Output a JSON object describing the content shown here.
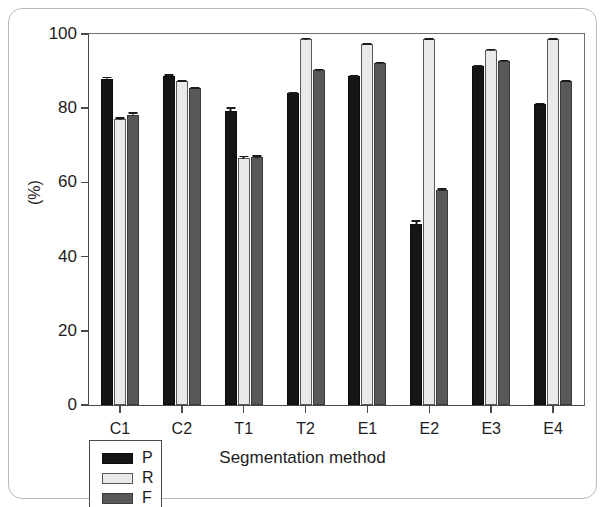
{
  "chart_data": {
    "type": "bar",
    "title": "",
    "subtitle": "",
    "xlabel": "Segmentation method",
    "ylabel": "(%)",
    "categories": [
      "C1",
      "C2",
      "T1",
      "T2",
      "E1",
      "E2",
      "E3",
      "E4"
    ],
    "ylim": [
      0,
      100
    ],
    "yticks": [
      0,
      20,
      40,
      60,
      80,
      100
    ],
    "ytick_labels": [
      "0",
      "20",
      "40",
      "60",
      "80",
      "100"
    ],
    "grid": false,
    "legend_position": "bottom-left",
    "error_bars": true,
    "series": [
      {
        "name": "P",
        "color": "#151515",
        "values": [
          88.0,
          88.8,
          79.3,
          84.0,
          88.6,
          48.8,
          91.3,
          81.2
        ],
        "errors": [
          0.8,
          0.6,
          1.2,
          0.5,
          0.5,
          1.3,
          0.5,
          0.5
        ]
      },
      {
        "name": "R",
        "color": "#e9e9e9",
        "values": [
          77.0,
          87.3,
          66.5,
          98.7,
          97.3,
          98.6,
          95.7,
          98.6
        ],
        "errors": [
          0.9,
          0.5,
          0.9,
          0.4,
          0.4,
          0.4,
          0.5,
          0.4
        ]
      },
      {
        "name": "F",
        "color": "#585858",
        "values": [
          78.3,
          85.4,
          66.8,
          90.4,
          92.2,
          57.9,
          92.8,
          87.3
        ],
        "errors": [
          0.9,
          0.5,
          0.8,
          0.5,
          0.4,
          0.8,
          0.5,
          0.5
        ]
      }
    ]
  },
  "legend": {
    "items": [
      {
        "label": "P",
        "series": "P"
      },
      {
        "label": "R",
        "series": "R"
      },
      {
        "label": "F",
        "series": "F"
      }
    ]
  },
  "axes": {
    "y_axis_label": "(%)",
    "x_axis_label": "Segmentation method"
  }
}
